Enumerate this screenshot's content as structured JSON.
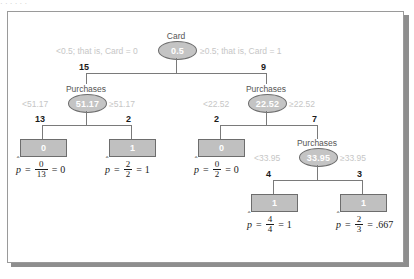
{
  "figure": {
    "top_clipped_text": "· ·   ·  ·  ·   ·",
    "type": "classification-decision-tree"
  },
  "tree": {
    "root": {
      "name": "root-node",
      "attribute_label": "Card",
      "split_value": "0.5",
      "left_condition": "<0.5; that is, Card = 0",
      "right_condition": "≥0.5; that is, Card = 1",
      "left_count": "15",
      "right_count": "9"
    },
    "left_branch": {
      "name": "purchases-node-left",
      "attribute_label": "Purchases",
      "split_value": "51.17",
      "left_condition": "<51.17",
      "right_condition": "≥51.17",
      "left_count": "13",
      "right_count": "2",
      "leaves": [
        {
          "name": "leaf-0-13",
          "class_value": "0",
          "phat": "p",
          "hat": "ˆ",
          "equals": "=",
          "numerator": "0",
          "denominator": "13",
          "result_equals": "=",
          "result": "0"
        },
        {
          "name": "leaf-1-2",
          "class_value": "1",
          "phat": "p",
          "hat": "ˆ",
          "equals": "=",
          "numerator": "2",
          "denominator": "2",
          "result_equals": "=",
          "result": "1"
        }
      ]
    },
    "right_branch": {
      "name": "purchases-node-right",
      "attribute_label": "Purchases",
      "split_value": "22.52",
      "left_condition": "<22.52",
      "right_condition": "≥22.52",
      "left_count": "2",
      "right_count": "7",
      "leaf": {
        "name": "leaf-0-2",
        "class_value": "0",
        "phat": "p",
        "hat": "ˆ",
        "equals": "=",
        "numerator": "0",
        "denominator": "2",
        "result_equals": "=",
        "result": "0"
      },
      "sub_branch": {
        "name": "purchases-node-deep",
        "attribute_label": "Purchases",
        "split_value": "33.95",
        "left_condition": "<33.95",
        "right_condition": "≥33.95",
        "left_count": "4",
        "right_count": "3",
        "leaves": [
          {
            "name": "leaf-1-4",
            "class_value": "1",
            "phat": "p",
            "hat": "ˆ",
            "equals": "=",
            "numerator": "4",
            "denominator": "4",
            "result_equals": "=",
            "result": "1"
          },
          {
            "name": "leaf-1-3",
            "class_value": "1",
            "phat": "p",
            "hat": "ˆ",
            "equals": "=",
            "numerator": "2",
            "denominator": "3",
            "result_equals": "=",
            "result": ".667"
          }
        ]
      }
    }
  },
  "colors": {
    "node_fill": "#c4c4c4",
    "node_stroke": "#6d6d6d",
    "leaf_fill": "#c0c0c0",
    "condition_text": "#c6c6c6",
    "label_text": "#555555",
    "panel_border": "#9a9a9a",
    "shadow": "#8e8e8e"
  }
}
